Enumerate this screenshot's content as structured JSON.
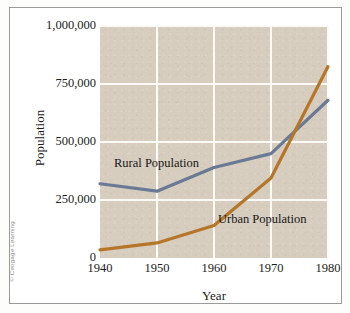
{
  "figure": {
    "credit": "© Cengage Learning"
  },
  "chart_data": {
    "type": "line",
    "title": "",
    "xlabel": "Year",
    "ylabel": "Population",
    "x": [
      1940,
      1950,
      1960,
      1970,
      1980
    ],
    "xlim": [
      1940,
      1980
    ],
    "ylim": [
      0,
      1000000
    ],
    "grid": true,
    "legend_position": "inline-annotations",
    "xticklabels": [
      "1940",
      "1950",
      "1960",
      "1970",
      "1980"
    ],
    "yticklabels": [
      "0",
      "250,000",
      "500,000",
      "750,000",
      "1,000,000"
    ],
    "yticks": [
      0,
      250000,
      500000,
      750000,
      1000000
    ],
    "series": [
      {
        "name": "Rural Population",
        "color": "#6b7a94",
        "values": [
          320000,
          288000,
          390000,
          450000,
          680000
        ]
      },
      {
        "name": "Urban Population",
        "color": "#b5762a",
        "values": [
          35000,
          65000,
          140000,
          345000,
          825000
        ]
      }
    ],
    "annotations": [
      {
        "text": "Rural Population",
        "series": "Rural Population"
      },
      {
        "text": "Urban Population",
        "series": "Urban Population"
      }
    ],
    "colors": {
      "plot_background": "#d7cdbe",
      "gridline": "#fbfaf7",
      "rural": "#6b7a94",
      "urban": "#b5762a",
      "text": "#1c1c1c"
    }
  }
}
